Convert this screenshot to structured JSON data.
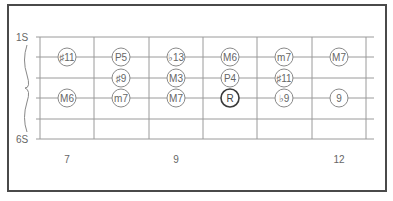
{
  "diagram": {
    "string_labels": {
      "top": "1S",
      "bottom": "6S"
    },
    "fret_numbers": [
      {
        "label": "7",
        "x": 67
      },
      {
        "label": "9",
        "x": 176
      },
      {
        "label": "12",
        "x": 339
      }
    ],
    "strings_y": [
      37,
      57,
      78,
      98,
      119,
      139
    ],
    "frets_x": [
      40,
      94,
      149,
      203,
      257,
      312,
      366
    ],
    "string_x_range": [
      36,
      374
    ],
    "colors": {
      "line": "#9a9a9a",
      "circle": "#8a8a8a",
      "root": "#3a3a3a",
      "text": "#666666",
      "frame": "#4a4a4a"
    },
    "notes": [
      {
        "label": "♯11",
        "string": 2,
        "x": 67
      },
      {
        "label": "P5",
        "string": 2,
        "x": 121
      },
      {
        "label": "♭13",
        "string": 2,
        "x": 176
      },
      {
        "label": "M6",
        "string": 2,
        "x": 230
      },
      {
        "label": "m7",
        "string": 2,
        "x": 284
      },
      {
        "label": "M7",
        "string": 2,
        "x": 339
      },
      {
        "label": "♯9",
        "string": 3,
        "x": 121
      },
      {
        "label": "M3",
        "string": 3,
        "x": 176
      },
      {
        "label": "P4",
        "string": 3,
        "x": 230
      },
      {
        "label": "♯11",
        "string": 3,
        "x": 284
      },
      {
        "label": "M6",
        "string": 4,
        "x": 67
      },
      {
        "label": "m7",
        "string": 4,
        "x": 121
      },
      {
        "label": "M7",
        "string": 4,
        "x": 176
      },
      {
        "label": "R",
        "string": 4,
        "x": 230,
        "root": true
      },
      {
        "label": "♭9",
        "string": 4,
        "x": 284
      },
      {
        "label": "9",
        "string": 4,
        "x": 339
      }
    ]
  }
}
